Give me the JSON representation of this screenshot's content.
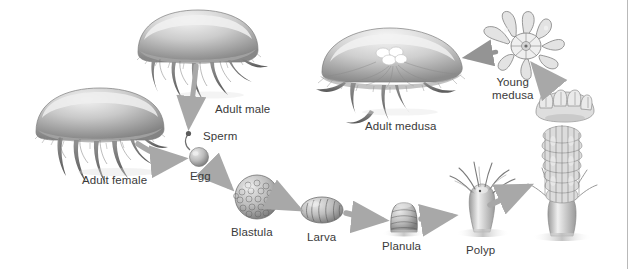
{
  "figure": {
    "width": 628,
    "height": 269,
    "background_color": "#ffffff",
    "border_color": "#b9b9b9",
    "label_color": "#3a3a3a",
    "arrow_color": "#a8a8a8",
    "art_tone_light": "#e8e8e8",
    "art_tone_mid": "#b0b0b0",
    "art_tone_dark": "#6e6e6e",
    "art_tone_darkest": "#4a4a4a"
  },
  "stages": [
    {
      "id": "adult-female",
      "label": "Adult female",
      "label_x": 82,
      "label_y": 174,
      "art_x": 30,
      "art_y": 88,
      "art_w": 140,
      "art_h": 88
    },
    {
      "id": "adult-male",
      "label": "Adult male",
      "label_x": 215,
      "label_y": 103,
      "art_x": 133,
      "art_y": 8,
      "art_w": 130,
      "art_h": 92
    },
    {
      "id": "sperm",
      "label": "Sperm",
      "label_x": 203,
      "label_y": 130,
      "art_x": 186,
      "art_y": 133,
      "art_w": 18,
      "art_h": 26
    },
    {
      "id": "egg",
      "label": "Egg",
      "label_x": 190,
      "label_y": 170,
      "art_x": 189,
      "art_y": 148,
      "art_w": 21,
      "art_h": 21
    },
    {
      "id": "blastula",
      "label": "Blastula",
      "label_x": 246,
      "label_y": 226,
      "art_x": 235,
      "art_y": 175,
      "art_w": 44,
      "art_h": 44
    },
    {
      "id": "larva",
      "label": "Larva",
      "label_x": 318,
      "label_y": 231,
      "art_x": 301,
      "art_y": 197,
      "art_w": 42,
      "art_h": 26
    },
    {
      "id": "planula",
      "label": "Planula",
      "label_x": 403,
      "label_y": 240,
      "art_x": 389,
      "art_y": 202,
      "art_w": 30,
      "art_h": 32
    },
    {
      "id": "polyp",
      "label": "Polyp",
      "label_x": 481,
      "label_y": 244,
      "art_x": 452,
      "art_y": 170,
      "art_w": 60,
      "art_h": 66
    },
    {
      "id": "strobila",
      "label": "",
      "label_x": 0,
      "label_y": 0,
      "art_x": 527,
      "art_y": 120,
      "art_w": 72,
      "art_h": 118
    },
    {
      "id": "ephyra",
      "label": "",
      "label_x": 0,
      "label_y": 0,
      "art_x": 535,
      "art_y": 88,
      "art_w": 62,
      "art_h": 38
    },
    {
      "id": "young-medusa",
      "label": "Young\nmedusa",
      "label_x": 492,
      "label_y": 76,
      "art_x": 482,
      "art_y": 22,
      "art_w": 78,
      "art_h": 48
    },
    {
      "id": "adult-medusa",
      "label": "Adult medusa",
      "label_x": 365,
      "label_y": 120,
      "art_x": 318,
      "art_y": 22,
      "art_w": 145,
      "art_h": 92
    }
  ],
  "arrows": [
    {
      "id": "male-to-sperm",
      "from": "adult-male",
      "to": "sperm"
    },
    {
      "id": "female-to-egg",
      "from": "adult-female",
      "to": "egg"
    },
    {
      "id": "egg-to-blastula",
      "from": "egg",
      "to": "blastula"
    },
    {
      "id": "blastula-to-larva",
      "from": "blastula",
      "to": "larva"
    },
    {
      "id": "larva-to-planula",
      "from": "larva",
      "to": "planula"
    },
    {
      "id": "planula-to-polyp",
      "from": "planula",
      "to": "polyp"
    },
    {
      "id": "polyp-to-strobila",
      "from": "polyp",
      "to": "strobila"
    },
    {
      "id": "strobila-to-young-medusa",
      "from": "strobila",
      "to": "young-medusa"
    },
    {
      "id": "young-medusa-to-adult-medusa",
      "from": "young-medusa",
      "to": "adult-medusa"
    }
  ]
}
